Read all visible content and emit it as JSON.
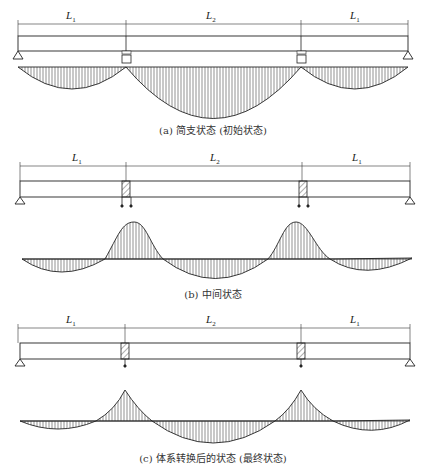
{
  "panels": [
    {
      "id": "a",
      "caption": "(a) 简支状态 (初始状态)",
      "span_labels": [
        "L1",
        "L2",
        "L1"
      ],
      "state": "simply-supported",
      "moment_diagram": "three positive parabolic lobes; center span deepest"
    },
    {
      "id": "b",
      "caption": "(b) 中间状态",
      "span_labels": [
        "L1",
        "L2",
        "L1"
      ],
      "state": "intermediate",
      "moment_diagram": "negative peaks over interior supports with rounded tops; sagging lobes in spans"
    },
    {
      "id": "c",
      "caption": "(c) 体系转换后的状态 (最终状态)",
      "span_labels": [
        "L1",
        "L2",
        "L1"
      ],
      "state": "continuous (final)",
      "moment_diagram": "sharp negative peaks over interior supports; sagging lobes in spans"
    }
  ],
  "labels": {
    "L1": "L",
    "L1_sub": "1",
    "L2": "L",
    "L2_sub": "2"
  }
}
